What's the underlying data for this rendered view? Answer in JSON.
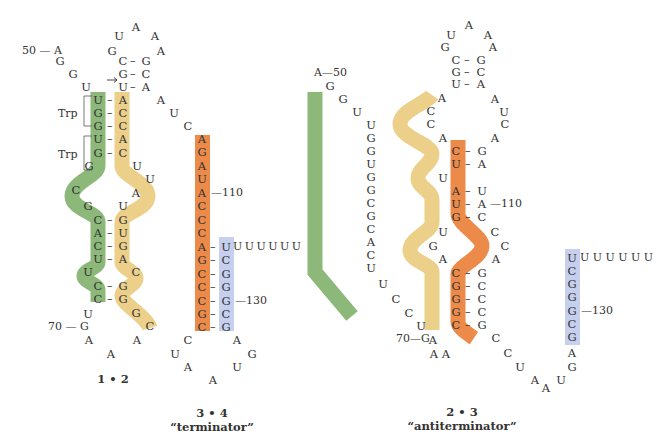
{
  "colors": {
    "seg1": "#8cb87a",
    "seg2": "#ecd08a",
    "seg3": "#ec8a4a",
    "seg4": "#c7cfee",
    "text": "#333333"
  },
  "structures": [
    {
      "id": "1-2",
      "caption": "1 • 2",
      "labels": {
        "pos50": "50 — A",
        "pos70": "70 — G",
        "pos110": "—110",
        "pos130": "—130",
        "trp1": "Trp",
        "trp2": "Trp",
        "tail": "U U U U U U"
      }
    },
    {
      "id": "3-4",
      "caption_line1": "3 • 4",
      "caption_line2": "“terminator”"
    },
    {
      "id": "2-3",
      "caption_line1": "2 • 3",
      "caption_line2": "“antiterminator”",
      "labels": {
        "pos50": "A—50",
        "pos70": "70—G",
        "pos110": "—110",
        "pos130": "—130",
        "tail": "U U U U U U"
      }
    }
  ],
  "sequences": {
    "s12_green": [
      "U",
      "G",
      "G",
      "U",
      "G",
      "G",
      "C",
      "G",
      "C",
      "A",
      "C",
      "U",
      "U",
      "C",
      "C"
    ],
    "s12_yellow": [
      "A",
      "C",
      "C",
      "A",
      "C",
      "U",
      "U",
      "A",
      "U",
      "G",
      "U",
      "G",
      "A",
      "C",
      "G",
      "G",
      "G",
      "C"
    ],
    "s12_orange": [
      "G",
      "A",
      "U",
      "A",
      "C",
      "C",
      "C",
      "A",
      "G",
      "C",
      "C",
      "C",
      "G",
      "C"
    ],
    "s12_blue": [
      "U",
      "C",
      "G",
      "G",
      "G",
      "C",
      "G"
    ],
    "s23_green": [
      "U",
      "G",
      "G",
      "U",
      "G",
      "G",
      "C",
      "G",
      "C",
      "A",
      "C",
      "U",
      "U",
      "C",
      "C"
    ],
    "s23_yellow": [
      "A",
      "C",
      "C",
      "A",
      "C",
      "U",
      "U",
      "A",
      "U",
      "G",
      "U",
      "G",
      "A",
      "C",
      "G",
      "G",
      "G",
      "C"
    ],
    "s23_orange": [
      "G",
      "A",
      "U",
      "A",
      "C",
      "C",
      "C",
      "A",
      "G",
      "C",
      "C",
      "C",
      "G",
      "C"
    ],
    "s23_blue": [
      "U",
      "C",
      "G",
      "G",
      "G",
      "C",
      "G"
    ]
  }
}
